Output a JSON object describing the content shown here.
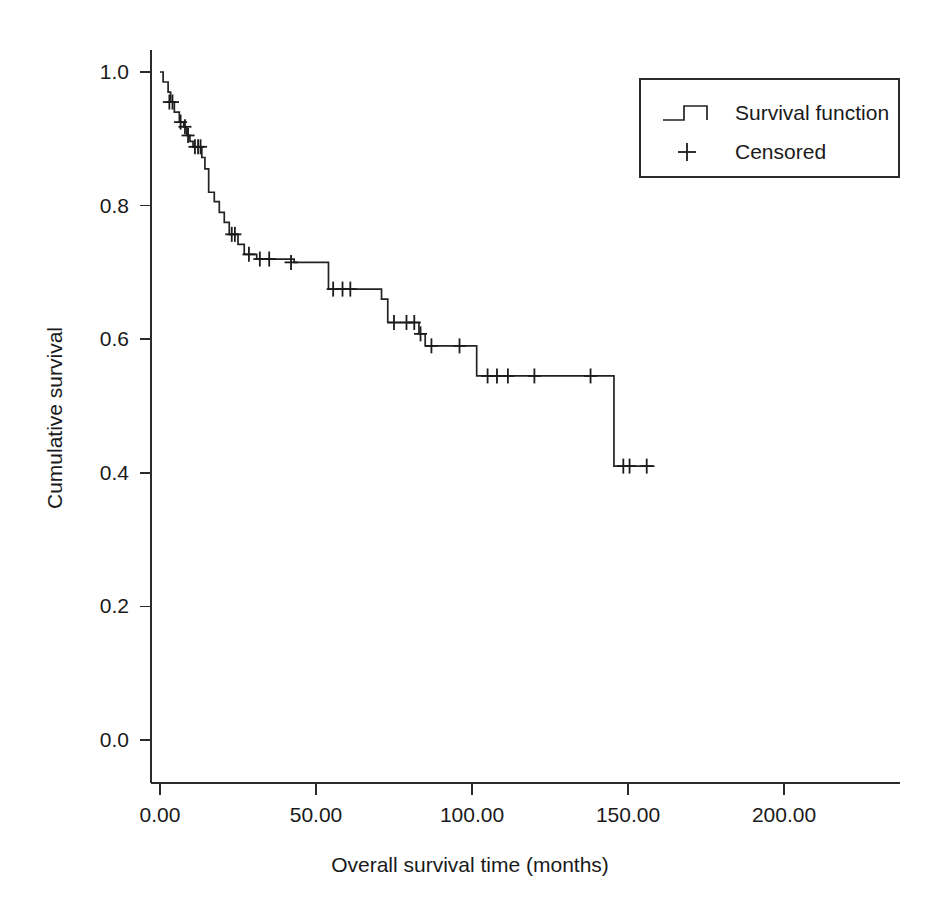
{
  "chart_data": {
    "type": "line",
    "subtype": "kaplan-meier-step",
    "title": "",
    "xlabel": "Overall survival time (months)",
    "ylabel": "Cumulative survival",
    "xlim": [
      -8,
      212
    ],
    "ylim": [
      -0.06,
      1.06
    ],
    "xticks": [
      0,
      50,
      100,
      150,
      200
    ],
    "xtick_labels": [
      "0.00",
      "50.00",
      "100.00",
      "150.00",
      "200.00"
    ],
    "yticks": [
      0.0,
      0.2,
      0.4,
      0.6,
      0.8,
      1.0
    ],
    "ytick_labels": [
      "0.0",
      "0.2",
      "0.4",
      "0.6",
      "0.8",
      "1.0"
    ],
    "grid": false,
    "legend_position": "top-right",
    "series": [
      {
        "name": "Survival function",
        "style": "step-post",
        "points": [
          [
            1.0,
            0.985
          ],
          [
            2.6,
            0.97
          ],
          [
            3.4,
            0.955
          ],
          [
            4.6,
            0.94
          ],
          [
            6.2,
            0.925
          ],
          [
            7.6,
            0.918
          ],
          [
            8.6,
            0.905
          ],
          [
            9.6,
            0.896
          ],
          [
            10.6,
            0.888
          ],
          [
            13.4,
            0.872
          ],
          [
            14.4,
            0.855
          ],
          [
            15.6,
            0.82
          ],
          [
            17.4,
            0.806
          ],
          [
            19.0,
            0.79
          ],
          [
            20.6,
            0.775
          ],
          [
            22.2,
            0.757
          ],
          [
            25.0,
            0.742
          ],
          [
            27.0,
            0.727
          ],
          [
            31.0,
            0.72
          ],
          [
            43.0,
            0.715
          ],
          [
            54.0,
            0.675
          ],
          [
            71.0,
            0.66
          ],
          [
            73.0,
            0.625
          ],
          [
            83.0,
            0.608
          ],
          [
            85.0,
            0.59
          ],
          [
            101.5,
            0.545
          ],
          [
            145.5,
            0.41
          ],
          [
            158.5,
            0.41
          ]
        ]
      }
    ],
    "censored": {
      "name": "Censored",
      "marker": "plus",
      "points": [
        [
          3.0,
          0.955
        ],
        [
          4.0,
          0.955
        ],
        [
          6.6,
          0.925
        ],
        [
          8.0,
          0.918
        ],
        [
          9.0,
          0.905
        ],
        [
          11.2,
          0.888
        ],
        [
          12.2,
          0.888
        ],
        [
          13.0,
          0.888
        ],
        [
          23.0,
          0.757
        ],
        [
          24.0,
          0.757
        ],
        [
          28.5,
          0.727
        ],
        [
          32.0,
          0.72
        ],
        [
          35.0,
          0.72
        ],
        [
          42.0,
          0.715
        ],
        [
          55.5,
          0.675
        ],
        [
          58.5,
          0.675
        ],
        [
          61.0,
          0.675
        ],
        [
          75.0,
          0.625
        ],
        [
          79.0,
          0.625
        ],
        [
          81.5,
          0.625
        ],
        [
          83.5,
          0.608
        ],
        [
          87.0,
          0.59
        ],
        [
          96.0,
          0.59
        ],
        [
          105.0,
          0.545
        ],
        [
          108.0,
          0.545
        ],
        [
          111.5,
          0.545
        ],
        [
          120.0,
          0.545
        ],
        [
          138.0,
          0.545
        ],
        [
          148.5,
          0.41
        ],
        [
          150.5,
          0.41
        ],
        [
          156.0,
          0.41
        ]
      ]
    }
  },
  "legend": {
    "entries": [
      {
        "label": "Survival function",
        "glyph": "step-line"
      },
      {
        "label": "Censored",
        "glyph": "plus-marker"
      }
    ]
  }
}
